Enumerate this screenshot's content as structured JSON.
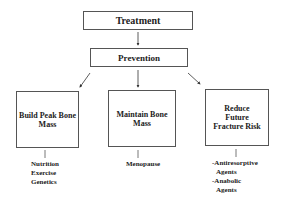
{
  "diagram": {
    "top": {
      "label": "Treatment"
    },
    "middle": {
      "label": "Prevention"
    },
    "branches": [
      {
        "label": "Build Peak Bone Mass",
        "details": [
          "Nutrition",
          "Exercise",
          "Genetics"
        ]
      },
      {
        "label": "Maintain Bone Mass",
        "details": [
          "Menopause"
        ]
      },
      {
        "label": "Reduce Future Fracture Risk",
        "details": [
          "-Antiresorptive",
          "Agents",
          "-Anabolic",
          "Agents"
        ]
      }
    ]
  }
}
